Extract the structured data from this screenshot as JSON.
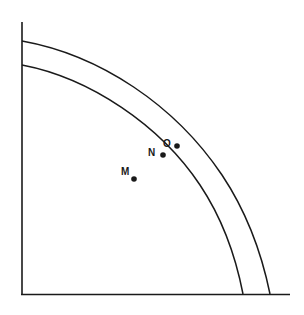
{
  "diagram": {
    "type": "production-possibilities-frontier",
    "axes": {
      "x_label": "",
      "y_label": ""
    },
    "curves": [
      {
        "name": "outer-frontier"
      },
      {
        "name": "inner-frontier"
      }
    ],
    "points": [
      {
        "label": "O",
        "position": "between the two frontiers"
      },
      {
        "label": "N",
        "position": "on the inner frontier"
      },
      {
        "label": "M",
        "position": "inside the inner frontier"
      }
    ],
    "colors": {
      "line": "#1a1a1a",
      "background": "#ffffff"
    }
  }
}
